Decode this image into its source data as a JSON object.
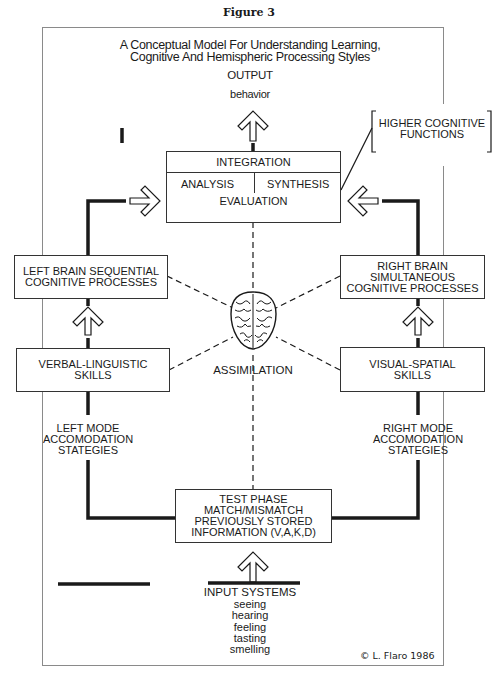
{
  "figure_label": "Figure 3",
  "title": {
    "line1": "A  Conceptual Model For Understanding Learning,",
    "line2": "Cognitive And Hemispheric Processing Styles"
  },
  "output": {
    "heading": "OUTPUT",
    "sub": "behavior"
  },
  "integration_box": {
    "header": "INTEGRATION",
    "left": "ANALYSIS",
    "right": "SYNTHESIS",
    "bottom": "EVALUATION"
  },
  "higher_cognitive": {
    "line1": "HIGHER COGNITIVE",
    "line2": "FUNCTIONS"
  },
  "left_brain_box": {
    "line1": "LEFT BRAIN SEQUENTIAL",
    "line2": "COGNITIVE PROCESSES"
  },
  "right_brain_box": {
    "line1": "RIGHT BRAIN",
    "line2": "SIMULTANEOUS",
    "line3": "COGNITIVE PROCESSES"
  },
  "verbal_box": {
    "line1": "VERBAL-LINGUISTIC",
    "line2": "SKILLS"
  },
  "visual_box": {
    "line1": "VISUAL-SPATIAL",
    "line2": "SKILLS"
  },
  "center": {
    "icon": "brain-icon",
    "label": "ASSIMILATION"
  },
  "left_mode": {
    "line1": "LEFT MODE",
    "line2": "ACCOMODATION",
    "line3": "STATEGIES"
  },
  "right_mode": {
    "line1": "RIGHT MODE",
    "line2": "ACCOMODATION",
    "line3": "STATEGIES"
  },
  "test_phase_box": {
    "line1": "TEST PHASE",
    "line2": "MATCH/MISMATCH",
    "line3": "PREVIOUSLY STORED",
    "line4": "INFORMATION (V,A,K,D)"
  },
  "input_systems": {
    "heading": "INPUT SYSTEMS",
    "senses": [
      "seeing",
      "hearing",
      "feeling",
      "tasting",
      "smelling"
    ]
  },
  "copyright": "© L. Flaro 1986",
  "colors": {
    "line": "#1a1a1a",
    "frame": "#8a8a8a",
    "background": "#ffffff"
  }
}
